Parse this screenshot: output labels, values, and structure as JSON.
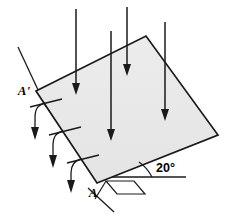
{
  "figure": {
    "background_color": "#ffffff",
    "line_color": "#1a1a1a",
    "plane_fill_color": "#e8e8e8"
  },
  "labels": {
    "upper_edge_point": "A'",
    "lower_edge_point": "A",
    "angle": "20°"
  },
  "plane": {
    "name": "inclined-plane",
    "fill": "#e8e8e8",
    "stroke": "#1a1a1a",
    "vertices": [
      [
        36,
        91
      ],
      [
        146,
        36
      ],
      [
        218,
        135
      ],
      [
        97,
        183
      ]
    ]
  },
  "rays": {
    "name": "vertical-incident-rays",
    "count": 4,
    "direction": "downward",
    "items": [
      {
        "x": 76,
        "y_start": 9,
        "y_end": 92
      },
      {
        "x": 111,
        "y_start": 31,
        "y_end": 138
      },
      {
        "x": 127,
        "y_start": 7,
        "y_end": 73
      },
      {
        "x": 165,
        "y_start": 22,
        "y_end": 118
      }
    ]
  },
  "projection_arrows": {
    "name": "projection-curved-arrows",
    "count": 3,
    "description": "curved arrows from plane edge bending to vertical downward",
    "items": [
      {
        "tick_from": [
          29,
          106
        ],
        "tick_to": [
          63,
          98
        ],
        "curve_start": [
          45,
          103
        ],
        "curve_end": [
          44,
          136
        ]
      },
      {
        "tick_from": [
          48,
          134
        ],
        "tick_to": [
          82,
          126
        ],
        "curve_start": [
          62,
          131
        ],
        "curve_end": [
          60,
          164
        ]
      },
      {
        "tick_from": [
          66,
          162
        ],
        "tick_to": [
          100,
          154
        ],
        "curve_start": [
          80,
          159
        ],
        "curve_end": [
          79,
          190
        ]
      }
    ]
  },
  "edge_extension": {
    "name": "edge-guide-line",
    "upper": {
      "from": [
        18,
        47
      ],
      "to": [
        44,
        103
      ]
    },
    "lower": {
      "from": [
        84,
        186
      ],
      "to": [
        113,
        211
      ]
    }
  },
  "horizontal_reference": {
    "name": "horizontal-reference-line",
    "from": [
      113,
      176
    ],
    "to": [
      185,
      176
    ]
  },
  "angle_marker": {
    "name": "angle-arc",
    "vertex": [
      113,
      176
    ],
    "value": "20°"
  },
  "perspective_marker": {
    "name": "ground-perspective-parallelogram",
    "points": [
      [
        103,
        182
      ],
      [
        115,
        195
      ],
      [
        143,
        195
      ],
      [
        131,
        182
      ]
    ],
    "tail": {
      "from": [
        103,
        182
      ],
      "to": [
        115,
        195
      ]
    }
  }
}
